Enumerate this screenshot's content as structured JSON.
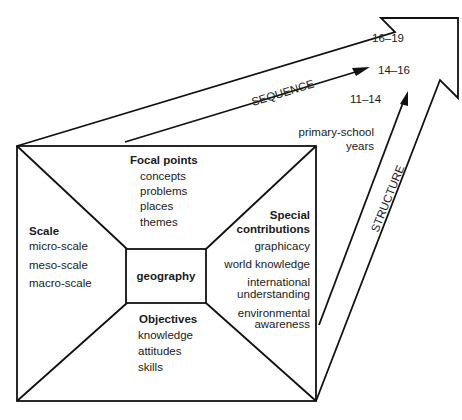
{
  "diagram": {
    "center": {
      "label": "geography"
    },
    "panels": {
      "top": {
        "heading": "Focal points",
        "items": [
          "concepts",
          "problems",
          "places",
          "themes"
        ]
      },
      "left": {
        "heading": "Scale",
        "items": [
          "micro-scale",
          "meso-scale",
          "macro-scale"
        ]
      },
      "bottom": {
        "heading": "Objectives",
        "items": [
          "knowledge",
          "attitudes",
          "skills"
        ]
      },
      "right": {
        "heading_line1": "Special",
        "heading_line2": "contributions",
        "items": [
          "graphicacy",
          "world knowledge",
          "international",
          "understanding",
          "environmental",
          "awareness"
        ]
      }
    },
    "arrows": {
      "sequence": {
        "label": "SEQUENCE"
      },
      "structure": {
        "label": "STRUCTURE"
      }
    },
    "stages": {
      "primary_line1": "primary-school",
      "primary_line2": "years",
      "s1": "11–14",
      "s2": "14–16",
      "s3": "16–19"
    }
  }
}
